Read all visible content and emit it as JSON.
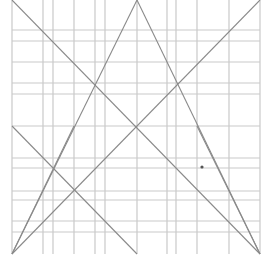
{
  "diagram": {
    "type": "geometric-line-construction",
    "width": 264,
    "height": 261,
    "colors": {
      "background": "#ffffff",
      "grid": "#c9c9c9",
      "diagonal": "#8a8a8a",
      "marker": "#555555"
    },
    "vertical_lines_x": [
      12,
      43,
      53,
      74,
      95,
      105,
      137,
      167,
      176,
      197,
      229,
      260
    ],
    "horizontal_lines_y": [
      30,
      41,
      62,
      83,
      94,
      126,
      158,
      168,
      191,
      200,
      221,
      232
    ],
    "grid_extent": {
      "x_min": 12,
      "x_max": 260,
      "y_min": 0,
      "y_max": 254
    },
    "diagonals": [
      {
        "name": "apex-left-edge",
        "x1": 137,
        "y1": 0,
        "x2": 12,
        "y2": 254
      },
      {
        "name": "apex-right-edge",
        "x1": 137,
        "y1": 0,
        "x2": 260,
        "y2": 254
      },
      {
        "name": "big-x-descending",
        "x1": 12,
        "y1": 0,
        "x2": 260,
        "y2": 254
      },
      {
        "name": "big-x-ascending",
        "x1": 260,
        "y1": 0,
        "x2": 12,
        "y2": 254
      },
      {
        "name": "lower-left-descending",
        "x1": 12,
        "y1": 126,
        "x2": 137,
        "y2": 254
      },
      {
        "name": "lower-left-steep",
        "x1": 12,
        "y1": 254,
        "x2": 74,
        "y2": 126
      },
      {
        "name": "lower-right-steep",
        "x1": 197,
        "y1": 126,
        "x2": 260,
        "y2": 254
      }
    ],
    "markers": [
      {
        "name": "dot",
        "x": 202,
        "y": 167,
        "r": 1.6
      }
    ]
  }
}
